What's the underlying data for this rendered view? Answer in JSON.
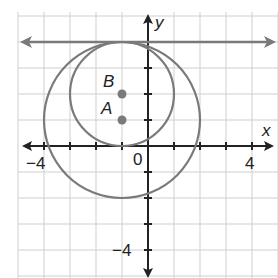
{
  "diagram": {
    "type": "coordinate-plane",
    "axes": {
      "x_label": "x",
      "y_label": "y",
      "origin_label": "0"
    },
    "tick_labels": {
      "x": [
        "−4",
        "4"
      ],
      "y": [
        "−4"
      ]
    },
    "points": [
      {
        "name": "B",
        "x": -1,
        "y": 2
      },
      {
        "name": "A",
        "x": -1,
        "y": 1
      }
    ],
    "circles": [
      {
        "center": "B",
        "radius": 2
      },
      {
        "center": "A",
        "radius": 3
      }
    ],
    "line": {
      "equation": "y = 4",
      "tangent_to": "both circles"
    },
    "colors": {
      "curve": "#7a7a7a",
      "point": "#7a7a7a",
      "grid": "#cfcfcf",
      "axis": "#222222"
    }
  }
}
